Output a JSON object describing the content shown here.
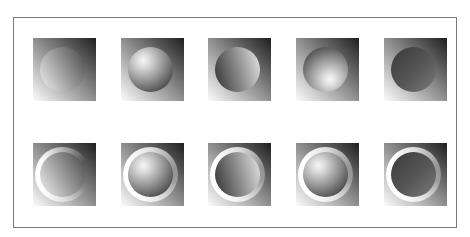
{
  "canvas": {
    "width": 470,
    "height": 237,
    "background": "#ffffff"
  },
  "frame": {
    "border_color": "#7a7a7a",
    "fill": "#ffffff"
  },
  "square": {
    "size_px": 63,
    "gradient_angle_deg": 45,
    "gradient_from": "#fcfcfc",
    "gradient_mid": "#8f8f8f",
    "gradient_to": "#1e1e1e",
    "gradient_direction": "light bottom-left to dark top-right"
  },
  "disc": {
    "diameter_px": 45
  },
  "ring": {
    "highlight_color": "#ffffff"
  },
  "grid": {
    "rows": 2,
    "cols": 5,
    "tiles": [
      {
        "id": "r1c1",
        "row": 1,
        "col": 1,
        "disc": "linear-match",
        "ring": "none"
      },
      {
        "id": "r1c2",
        "row": 1,
        "col": 2,
        "disc": "sphere-lit-top-left",
        "ring": "none"
      },
      {
        "id": "r1c3",
        "row": 1,
        "col": 3,
        "disc": "linear-reversed",
        "ring": "none"
      },
      {
        "id": "r1c4",
        "row": 1,
        "col": 4,
        "disc": "sphere-lit-bottom-right",
        "ring": "none"
      },
      {
        "id": "r1c5",
        "row": 1,
        "col": 5,
        "disc": "dark-disc",
        "ring": "none"
      },
      {
        "id": "r2c1",
        "row": 2,
        "col": 1,
        "disc": "linear-match",
        "ring": "open-right"
      },
      {
        "id": "r2c2",
        "row": 2,
        "col": 2,
        "disc": "sphere-lit-top-left",
        "ring": "full"
      },
      {
        "id": "r2c3",
        "row": 2,
        "col": 3,
        "disc": "linear-reversed",
        "ring": "full"
      },
      {
        "id": "r2c4",
        "row": 2,
        "col": 4,
        "disc": "sphere-lit-top-left",
        "ring": "full"
      },
      {
        "id": "r2c5",
        "row": 2,
        "col": 5,
        "disc": "dark-disc",
        "ring": "full"
      }
    ]
  }
}
